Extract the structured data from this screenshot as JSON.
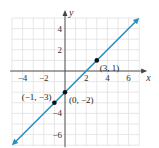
{
  "chart_data": {
    "type": "line",
    "title": "",
    "xlabel": "x",
    "ylabel": "y",
    "xlim": [
      -5,
      7
    ],
    "ylim": [
      -7,
      5
    ],
    "grid": true,
    "x_ticks": [
      -4,
      -2,
      2,
      4,
      6
    ],
    "y_ticks": [
      4,
      2,
      -4,
      -6
    ],
    "x_tick_labels": [
      "−4",
      "−2",
      "2",
      "4",
      "6"
    ],
    "y_tick_labels": [
      "4",
      "2",
      "−4",
      "−6"
    ],
    "series": [
      {
        "name": "y = x - 2",
        "color": "#2a8fbd",
        "x": [
          -5,
          7
        ],
        "y": [
          -7,
          5
        ],
        "arrows": "both"
      }
    ],
    "points": [
      {
        "x": 3,
        "y": 1,
        "label": "(3, 1)"
      },
      {
        "x": 0,
        "y": -2,
        "label": "(0, −2)"
      },
      {
        "x": -1,
        "y": -3,
        "label": "(−1, −3)"
      }
    ]
  }
}
